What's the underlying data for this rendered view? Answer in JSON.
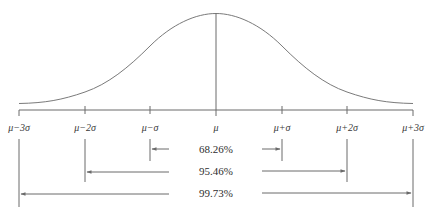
{
  "diagram": {
    "title": "",
    "type": "normal-distribution-empirical-rule",
    "axis_labels": [
      {
        "key": "m3",
        "text": "μ−3σ",
        "x": 19
      },
      {
        "key": "m2",
        "text": "μ−2σ",
        "x": 85
      },
      {
        "key": "m1",
        "text": "μ−σ",
        "x": 150
      },
      {
        "key": "mu",
        "text": "μ",
        "x": 216
      },
      {
        "key": "p1",
        "text": "μ+σ",
        "x": 282
      },
      {
        "key": "p2",
        "text": "μ+2σ",
        "x": 347
      },
      {
        "key": "p3",
        "text": "μ+3σ",
        "x": 413
      }
    ],
    "intervals": [
      {
        "label": "68.26%",
        "from": "μ−σ",
        "to": "μ+σ"
      },
      {
        "label": "95.46%",
        "from": "μ−2σ",
        "to": "μ+2σ"
      },
      {
        "label": "99.73%",
        "from": "μ−3σ",
        "to": "μ+3σ"
      }
    ],
    "colors": {
      "line": "#6a6a6a",
      "text": "#333333",
      "background": "#ffffff"
    }
  }
}
